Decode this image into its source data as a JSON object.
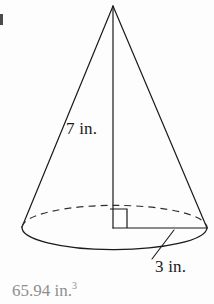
{
  "figure": {
    "name": "cone-volume-figure",
    "shape": "cone",
    "background_color": "#fdfdfd",
    "stroke_color": "#1a1a1a",
    "labels": {
      "slant_height": "7 in.",
      "radius": "3 in."
    },
    "apex": {
      "x": 113,
      "y": 6
    },
    "base_center": {
      "x": 113,
      "y": 227
    },
    "base_radius_x": 92,
    "base_radius_y": 22,
    "right_angle_marker": {
      "x": 110,
      "y": 208,
      "size": 17
    },
    "hidden_back_edge_style": "dashed",
    "leader_line": {
      "x1": 152,
      "y1": 258,
      "x2": 173,
      "y2": 231
    }
  },
  "answer": {
    "value": "65.94 in.",
    "exponent": "3",
    "color": "#8e8e8e"
  },
  "artifact": {
    "description": "clipped-mark"
  }
}
